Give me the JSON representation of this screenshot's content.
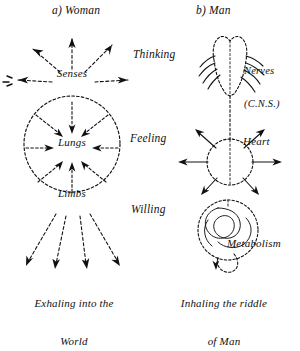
{
  "figure": {
    "type": "diagram",
    "style": "hand-drawn ink sketch, two-panel anthroposophical illustration",
    "panels": [
      {
        "id": "woman",
        "title": "a) Woman",
        "organs": [
          "Senses",
          "Lungs",
          "Limbs"
        ],
        "caption_line1": "Exhaling into the",
        "caption_line2": "World",
        "arrow_direction": "outward / exhaling",
        "shape": "circle"
      },
      {
        "id": "man",
        "title": "b) Man",
        "organ_labels": [
          {
            "line1": "Nerves",
            "line2": "(C.N.S.)"
          },
          {
            "line1": "Heart",
            "line2": ""
          },
          {
            "line1": "Metabolism",
            "line2": ""
          }
        ],
        "caption_line1": "Inhaling the riddle",
        "caption_line2": "of Man",
        "arrow_direction": "inward / inhaling",
        "shape": "brain, heart-circle and coiled metabolism"
      }
    ],
    "middle_column": [
      "Thinking",
      "Feeling",
      "Willing"
    ],
    "colors": {
      "ink": "#111111",
      "background": "#ffffff"
    }
  }
}
